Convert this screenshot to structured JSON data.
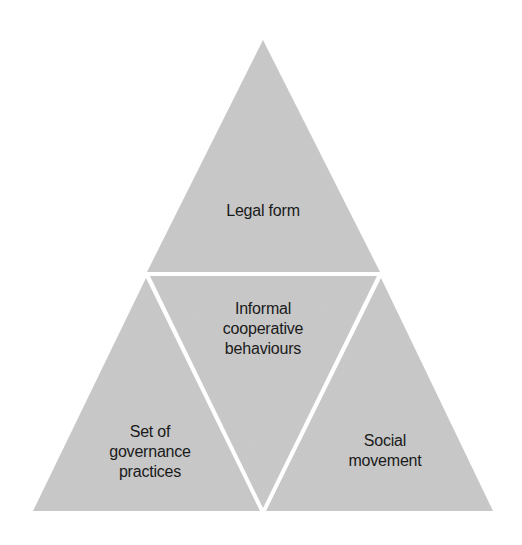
{
  "diagram": {
    "fill_color": "#c9c9c9",
    "separator_color": "#ffffff",
    "segments": {
      "top": {
        "lines": [
          "Legal form"
        ]
      },
      "center": {
        "lines": [
          "Informal",
          "cooperative",
          "behaviours"
        ]
      },
      "left": {
        "lines": [
          "Set of",
          "governance",
          "practices"
        ]
      },
      "right": {
        "lines": [
          "Social",
          "movement"
        ]
      }
    }
  }
}
